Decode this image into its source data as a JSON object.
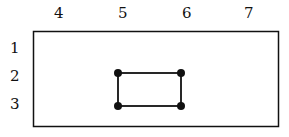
{
  "diagram": {
    "column_labels": [
      {
        "text": "4",
        "x": 58
      },
      {
        "text": "5",
        "x": 122
      },
      {
        "text": "6",
        "x": 186
      },
      {
        "text": "7",
        "x": 248
      }
    ],
    "row_labels": [
      {
        "text": "1",
        "y": 48
      },
      {
        "text": "2",
        "y": 76
      },
      {
        "text": "3",
        "y": 104
      }
    ],
    "outer_box": {
      "x1": 33,
      "y1": 31,
      "x2": 278,
      "y2": 127
    },
    "nodes": [
      {
        "col": "5",
        "row": "2"
      },
      {
        "col": "6",
        "row": "2"
      },
      {
        "col": "5",
        "row": "3"
      },
      {
        "col": "6",
        "row": "3"
      }
    ],
    "colors": {
      "stroke": "#111111",
      "background": "#ffffff"
    }
  }
}
